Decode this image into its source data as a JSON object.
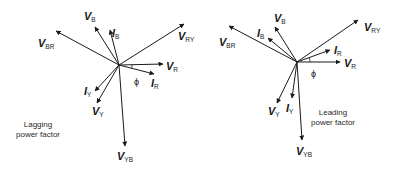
{
  "diagrams": [
    {
      "id": "lagging",
      "caption_lines": [
        "Lagging",
        "power factor"
      ],
      "center": [
        119,
        65
      ],
      "phasors": [
        {
          "name": "V",
          "sub": "BR",
          "tip": [
            56,
            31
          ],
          "label_pos": [
            38,
            47
          ]
        },
        {
          "name": "V",
          "sub": "B",
          "tip": [
            95,
            27
          ],
          "label_pos": [
            84,
            20
          ]
        },
        {
          "name": "I",
          "sub": "B",
          "tip": [
            110,
            30
          ],
          "label_pos": [
            112,
            37
          ]
        },
        {
          "name": "V",
          "sub": "RY",
          "tip": [
            184,
            24
          ],
          "label_pos": [
            178,
            40
          ]
        },
        {
          "name": "V",
          "sub": "R",
          "tip": [
            163,
            64
          ],
          "label_pos": [
            166,
            70
          ]
        },
        {
          "name": "I",
          "sub": "R",
          "tip": [
            154,
            74
          ],
          "label_pos": [
            151,
            87
          ]
        },
        {
          "name": "I",
          "sub": "Y",
          "tip": [
            95,
            91
          ],
          "label_pos": [
            84,
            95
          ]
        },
        {
          "name": "V",
          "sub": "Y",
          "tip": [
            97,
            103
          ],
          "label_pos": [
            92,
            115
          ]
        },
        {
          "name": "V",
          "sub": "YB",
          "tip": [
            125,
            146
          ],
          "label_pos": [
            117,
            160
          ]
        }
      ],
      "angle_label": "ϕ",
      "angle_label_pos": [
        134,
        85
      ]
    },
    {
      "id": "leading",
      "caption_lines": [
        "Leading",
        "power factor"
      ],
      "center": [
        297,
        62
      ],
      "phasors": [
        {
          "name": "V",
          "sub": "BR",
          "tip": [
            229,
            26
          ],
          "label_pos": [
            219,
            46
          ]
        },
        {
          "name": "V",
          "sub": "B",
          "tip": [
            275,
            27
          ],
          "label_pos": [
            274,
            22
          ]
        },
        {
          "name": "I",
          "sub": "B",
          "tip": [
            268,
            38
          ],
          "label_pos": [
            257,
            37
          ]
        },
        {
          "name": "V",
          "sub": "RY",
          "tip": [
            358,
            20
          ],
          "label_pos": [
            364,
            31
          ]
        },
        {
          "name": "I",
          "sub": "R",
          "tip": [
            330,
            50
          ],
          "label_pos": [
            334,
            54
          ]
        },
        {
          "name": "V",
          "sub": "R",
          "tip": [
            340,
            62
          ],
          "label_pos": [
            344,
            67
          ]
        },
        {
          "name": "V",
          "sub": "Y",
          "tip": [
            277,
            103
          ],
          "label_pos": [
            268,
            115
          ]
        },
        {
          "name": "I",
          "sub": "Y",
          "tip": [
            292,
            98
          ],
          "label_pos": [
            286,
            112
          ]
        },
        {
          "name": "V",
          "sub": "YB",
          "tip": [
            302,
            140
          ],
          "label_pos": [
            296,
            155
          ]
        }
      ],
      "angle_label": "ϕ",
      "angle_label_pos": [
        311,
        77
      ]
    }
  ],
  "colors": {
    "stroke": "#1a1a1a",
    "background": "#ffffff"
  }
}
